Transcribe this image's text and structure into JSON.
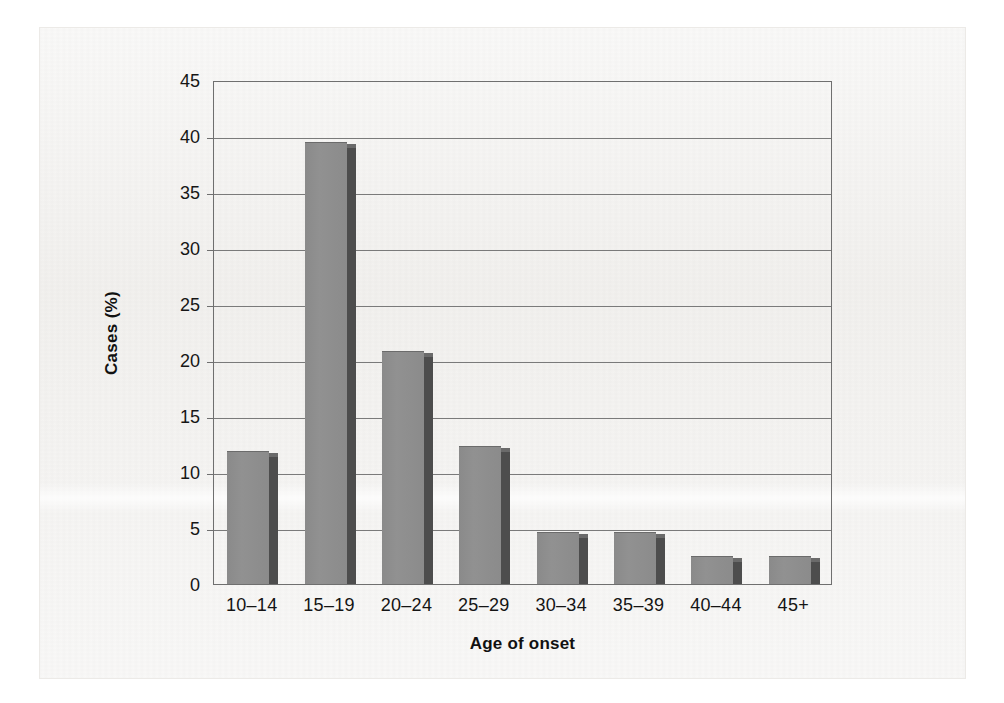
{
  "chart_data": {
    "type": "bar",
    "title": "",
    "subtitle": "",
    "xlabel": "Age of onset",
    "ylabel": "Cases (%)",
    "categories": [
      "10–14",
      "15–19",
      "20–24",
      "25–29",
      "30–34",
      "35–39",
      "40–44",
      "45+"
    ],
    "values": [
      11.9,
      39.5,
      20.8,
      12.3,
      4.6,
      4.6,
      2.5,
      2.5
    ],
    "ylim": [
      0,
      45
    ],
    "ytick_step": 5,
    "yticks": [
      "0",
      "5",
      "10",
      "15",
      "20",
      "25",
      "30",
      "35",
      "40",
      "45"
    ],
    "grid": "horizontal",
    "legend": "none",
    "series": [
      {
        "name": "Cases (%)",
        "values": [
          11.9,
          39.5,
          20.8,
          12.3,
          4.6,
          4.6,
          2.5,
          2.5
        ]
      }
    ]
  },
  "style": {
    "bar_face_color": "#8d8d8d",
    "bar_shadow_color": "#4d4d4d",
    "axis_color": "#6f6f6f",
    "grid_color": "#7a7a7a",
    "paper_color": "#f3f2f0",
    "text_color": "#141414"
  }
}
